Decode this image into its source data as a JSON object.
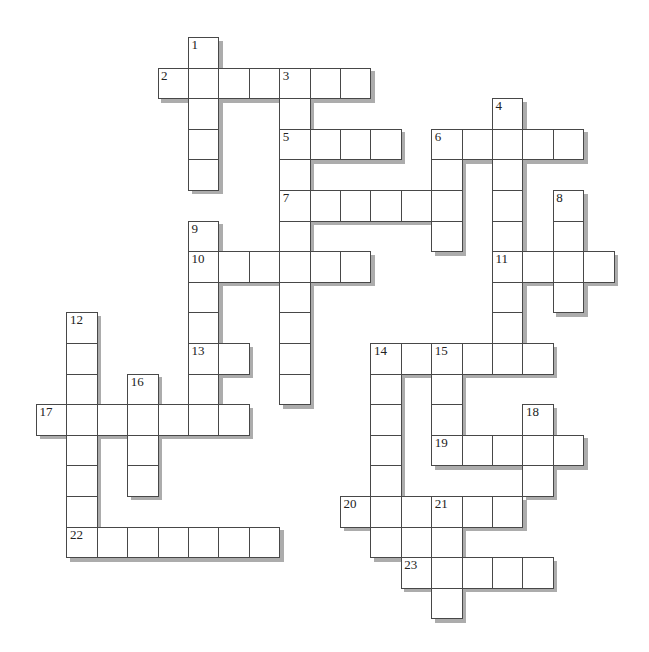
{
  "page": {
    "background": "#ffffff",
    "width": 649,
    "height": 652
  },
  "puzzle": {
    "kind": "crossword-grid",
    "style": {
      "origin_x": 36,
      "origin_y": 37,
      "cell_width": 30.4,
      "cell_height": 30.6,
      "border_color": "#484848",
      "cell_fill": "#ffffff",
      "shadow_color": "#acacac",
      "shadow_offset": 3.5,
      "number_color": "#222222",
      "number_font_size": 13
    },
    "holes": [
      {
        "row": 16,
        "col": 12
      }
    ],
    "entries": [
      {
        "number": 1,
        "direction": "down",
        "row": 0,
        "col": 5,
        "length": 5
      },
      {
        "number": 2,
        "direction": "across",
        "row": 1,
        "col": 4,
        "length": 7
      },
      {
        "number": 3,
        "direction": "down",
        "row": 1,
        "col": 8,
        "length": 11
      },
      {
        "number": 4,
        "direction": "down",
        "row": 2,
        "col": 15,
        "length": 9
      },
      {
        "number": 5,
        "direction": "across",
        "row": 3,
        "col": 8,
        "length": 4
      },
      {
        "number": 6,
        "direction": "across",
        "row": 3,
        "col": 13,
        "length": 5
      },
      {
        "number": 6,
        "direction": "down",
        "row": 3,
        "col": 13,
        "length": 4
      },
      {
        "number": 7,
        "direction": "across",
        "row": 5,
        "col": 8,
        "length": 6
      },
      {
        "number": 8,
        "direction": "down",
        "row": 5,
        "col": 17,
        "length": 4
      },
      {
        "number": 9,
        "direction": "down",
        "row": 6,
        "col": 5,
        "length": 7
      },
      {
        "number": 10,
        "direction": "across",
        "row": 7,
        "col": 5,
        "length": 6
      },
      {
        "number": 11,
        "direction": "across",
        "row": 7,
        "col": 15,
        "length": 4
      },
      {
        "number": 12,
        "direction": "down",
        "row": 9,
        "col": 1,
        "length": 8
      },
      {
        "number": 13,
        "direction": "across",
        "row": 10,
        "col": 5,
        "length": 2
      },
      {
        "number": 14,
        "direction": "across",
        "row": 10,
        "col": 11,
        "length": 6
      },
      {
        "number": 14,
        "direction": "down",
        "row": 10,
        "col": 11,
        "length": 7
      },
      {
        "number": 15,
        "direction": "down",
        "row": 10,
        "col": 13,
        "length": 4
      },
      {
        "number": 16,
        "direction": "down",
        "row": 11,
        "col": 3,
        "length": 4
      },
      {
        "number": 17,
        "direction": "across",
        "row": 12,
        "col": 0,
        "length": 7
      },
      {
        "number": 18,
        "direction": "down",
        "row": 12,
        "col": 16,
        "length": 3
      },
      {
        "number": 19,
        "direction": "across",
        "row": 13,
        "col": 13,
        "length": 5
      },
      {
        "number": 20,
        "direction": "across",
        "row": 15,
        "col": 10,
        "length": 6
      },
      {
        "number": 21,
        "direction": "down",
        "row": 15,
        "col": 13,
        "length": 4
      },
      {
        "number": 22,
        "direction": "across",
        "row": 16,
        "col": 1,
        "length": 7
      },
      {
        "number": 23,
        "direction": "across",
        "row": 17,
        "col": 12,
        "length": 5
      }
    ]
  }
}
